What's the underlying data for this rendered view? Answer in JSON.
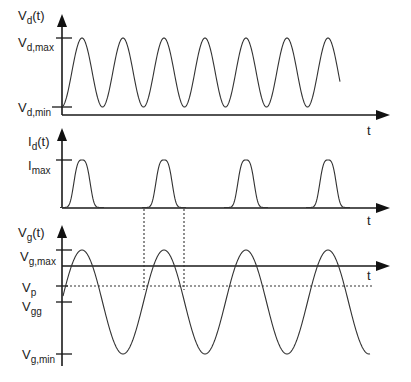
{
  "figure": {
    "panels": [
      {
        "id": "drain-voltage",
        "y_label_main": "V",
        "y_label_sub": "d",
        "y_label_suffix": "(t)",
        "x_label": "t",
        "ticks": [
          {
            "main": "V",
            "sub": "d,max"
          },
          {
            "main": "V",
            "sub": "d,min"
          }
        ],
        "waveform": "sinusoid",
        "cycles": 7
      },
      {
        "id": "drain-current",
        "y_label_main": "I",
        "y_label_sub": "d",
        "y_label_suffix": "(t)",
        "x_label": "t",
        "ticks": [
          {
            "main": "I",
            "sub": "max"
          }
        ],
        "waveform": "pulse-train",
        "pulses": 4
      },
      {
        "id": "gate-voltage",
        "y_label_main": "V",
        "y_label_sub": "g",
        "y_label_suffix": "(t)",
        "x_label": "t",
        "ticks": [
          {
            "main": "V",
            "sub": "g,max"
          },
          {
            "main": "V",
            "sub": "p"
          },
          {
            "main": "V",
            "sub": "gg"
          },
          {
            "main": "V",
            "sub": "g,min"
          }
        ],
        "waveform": "sinusoid",
        "cycles": 4
      }
    ],
    "annotations": {
      "conduction_window": "dotted vertical lines linking Id pulse to Vg above Vp"
    }
  }
}
